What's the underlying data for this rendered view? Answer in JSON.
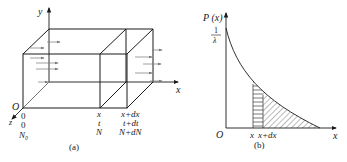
{
  "figure_a": {
    "caption": "(a)",
    "axis_y_label": "y",
    "axis_x_label": "x",
    "axis_z_label": "z",
    "origin_label": "O",
    "left_face_labels": [
      "0",
      "0",
      "N₀"
    ],
    "section_x_labels": [
      "x",
      "t",
      "N"
    ],
    "section_xdx_labels": [
      "x+dx",
      "t+dt",
      "N+dN"
    ]
  },
  "figure_b": {
    "caption": "(b)",
    "y_axis_label": "P (x)",
    "y_intercept_numerator": "1",
    "y_intercept_denominator": "λ",
    "origin_label": "O",
    "x_axis_label": "x",
    "strip_left_label": "x",
    "strip_right_label": "x+dx"
  },
  "colors": {
    "line": "#1a1a1a",
    "arrow": "#777777",
    "hatch": "#555555"
  }
}
